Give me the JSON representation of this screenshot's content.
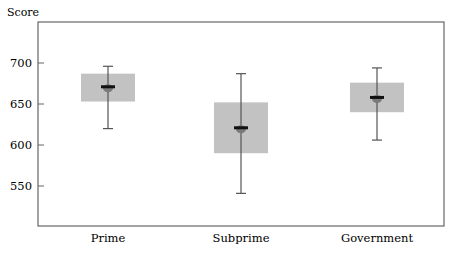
{
  "chart_data": {
    "type": "box",
    "title": "",
    "ylabel": "Score",
    "xlabel": "",
    "ylim": [
      500,
      748
    ],
    "yticks": [
      550,
      600,
      650,
      700
    ],
    "grid": false,
    "legend": null,
    "categories": [
      "Prime",
      "Subprime",
      "Government"
    ],
    "series": [
      {
        "name": "Prime",
        "whisker_high": 696,
        "q3": 687,
        "median": 671,
        "q1": 653,
        "whisker_low": 620
      },
      {
        "name": "Subprime",
        "whisker_high": 687,
        "q3": 652,
        "median": 621,
        "q1": 590,
        "whisker_low": 541
      },
      {
        "name": "Government",
        "whisker_high": 694,
        "q3": 676,
        "median": 658,
        "q1": 640,
        "whisker_low": 606
      }
    ],
    "colors": {
      "box_fill": "#c2c2c2",
      "median": "#111111",
      "mean_marker": "#7a7a7a",
      "whisker": "#555555",
      "axis": "#666666"
    }
  }
}
